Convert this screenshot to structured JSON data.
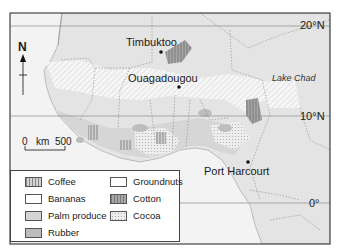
{
  "map": {
    "cities": [
      {
        "name": "Timbuktoo",
        "x": 153,
        "y": 40
      },
      {
        "name": "Ouagadougou",
        "x": 127,
        "y": 75
      },
      {
        "name": "Port Harcourt",
        "x": 205,
        "y": 168
      }
    ],
    "water": [
      {
        "name": "Lake Chad",
        "x": 271,
        "y": 76
      }
    ],
    "latitudes": [
      {
        "label": "20°N",
        "y": 26
      },
      {
        "label": "10°N",
        "y": 116
      },
      {
        "label": "0°",
        "y": 203
      }
    ],
    "north_arrow": {
      "label": "N"
    },
    "scale_bar": {
      "start": "0",
      "unit": "km",
      "end": "500"
    },
    "legend": {
      "items": [
        {
          "label": "Coffee",
          "pattern": "vertical-hatch"
        },
        {
          "label": "Bananas",
          "pattern": "white"
        },
        {
          "label": "Palm produce",
          "pattern": "light-grey"
        },
        {
          "label": "Rubber",
          "pattern": "medium-grey"
        },
        {
          "label": "Groundnuts",
          "pattern": "white"
        },
        {
          "label": "Cotton",
          "pattern": "dark-grey-hatch"
        },
        {
          "label": "Cocoa",
          "pattern": "dotted"
        }
      ]
    },
    "colors": {
      "land": "#e6e6e6",
      "sea": "#f4f4f4",
      "palm": "#d4d4d4",
      "rubber": "#bdbdbd",
      "cotton": "#9a9a9a",
      "frame": "#444444"
    }
  }
}
